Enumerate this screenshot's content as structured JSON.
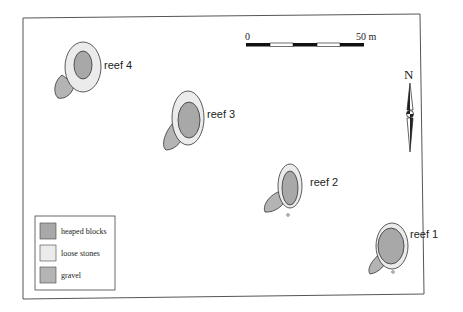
{
  "colors": {
    "frame": "#555555",
    "heaped_blocks": "#a8a8a8",
    "loose_stones": "#ebebeb",
    "gravel": "#b4b4b4",
    "outline": "#333333"
  },
  "reefs": [
    {
      "id": "reef-1",
      "label": "reef 1"
    },
    {
      "id": "reef-2",
      "label": "reef 2"
    },
    {
      "id": "reef-3",
      "label": "reef 3"
    },
    {
      "id": "reef-4",
      "label": "reef 4"
    }
  ],
  "scale_bar": {
    "start_label": "0",
    "end_label": "50 m",
    "segments": 5
  },
  "north_arrow": {
    "label": "N"
  },
  "legend": {
    "items": [
      {
        "swatch": "heaped_blocks",
        "label": "heaped blocks"
      },
      {
        "swatch": "loose_stones",
        "label": "loose stones"
      },
      {
        "swatch": "gravel",
        "label": "gravel"
      }
    ]
  }
}
